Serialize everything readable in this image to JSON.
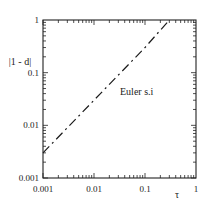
{
  "chart_data": {
    "type": "line",
    "title": "",
    "xlabel": "τ",
    "ylabel": "|1 - d|",
    "xscale": "log",
    "yscale": "log",
    "xlim": [
      0.001,
      1
    ],
    "ylim": [
      0.001,
      1
    ],
    "x_ticks": [
      "0.001",
      "0.01",
      "0.1",
      "1"
    ],
    "y_ticks": [
      "0.001",
      "0.01",
      "0.1",
      "1"
    ],
    "grid": false,
    "series": [
      {
        "name": "Euler s.i",
        "style": "dash-dot",
        "color": "#1a1a1a",
        "x": [
          0.001,
          0.01,
          0.1,
          0.3
        ],
        "y": [
          0.003,
          0.03,
          0.3,
          1.0
        ]
      }
    ],
    "annotations": [
      {
        "text": "Euler s.i",
        "x": 0.06,
        "y": 0.06
      }
    ]
  },
  "labels": {
    "ylabel": "|1 - d|",
    "xlabel": "τ",
    "series_label": "Euler s.i",
    "x_ticks": [
      "0.001",
      "0.01",
      "0.1",
      "1"
    ],
    "y_ticks": [
      "0.001",
      "0.01",
      "0.1",
      "1"
    ]
  }
}
